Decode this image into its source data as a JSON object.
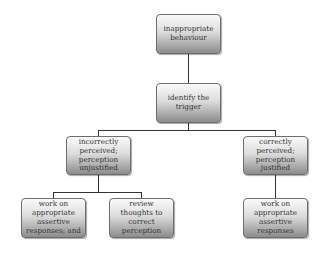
{
  "diagram": {
    "type": "flowchart-tree",
    "nodes": [
      {
        "id": "root",
        "label": "inappropriate behaviour"
      },
      {
        "id": "trigger",
        "label": "identify the trigger"
      },
      {
        "id": "incorrect",
        "label": "incorrectly perceived; perception unjustified"
      },
      {
        "id": "correct",
        "label": "correctly perceived; perception justified"
      },
      {
        "id": "assertive_and",
        "label": "work on appropriate assertive responses; and"
      },
      {
        "id": "review",
        "label": "review thoughts to correct perception"
      },
      {
        "id": "assertive",
        "label": "work on appropriate assertive responses"
      }
    ],
    "edges": [
      [
        "root",
        "trigger"
      ],
      [
        "trigger",
        "incorrect"
      ],
      [
        "trigger",
        "correct"
      ],
      [
        "incorrect",
        "assertive_and"
      ],
      [
        "incorrect",
        "review"
      ],
      [
        "correct",
        "assertive"
      ]
    ]
  }
}
